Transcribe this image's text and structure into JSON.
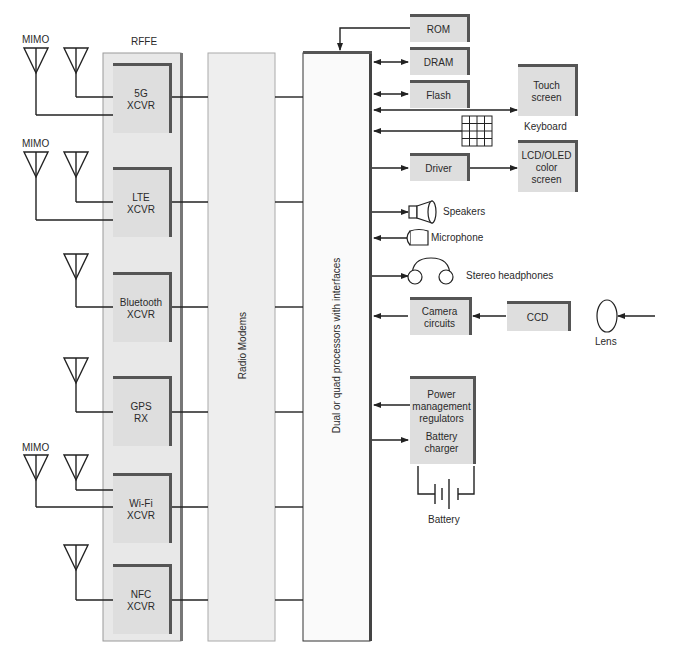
{
  "diagram": {
    "rffe_label": "RFFE",
    "radio_modems_label": "Radio Modems",
    "processor_label": "Dual or quad processors with interfaces",
    "antenna_labels": {
      "mimo_top": "MIMO",
      "mimo_lte": "MIMO",
      "mimo_wifi": "MIMO"
    },
    "transceivers": [
      {
        "line1": "5G",
        "line2": "XCVR"
      },
      {
        "line1": "LTE",
        "line2": "XCVR"
      },
      {
        "line1": "Bluetooth",
        "line2": "XCVR"
      },
      {
        "line1": "GPS",
        "line2": "RX"
      },
      {
        "line1": "Wi-Fi",
        "line2": "XCVR"
      },
      {
        "line1": "NFC",
        "line2": "XCVR"
      }
    ],
    "memory": {
      "rom": "ROM",
      "dram": "DRAM",
      "flash": "Flash"
    },
    "touch_screen": {
      "line1": "Touch",
      "line2": "screen"
    },
    "keyboard": "Keyboard",
    "driver": "Driver",
    "display": {
      "line1": "LCD/OLED",
      "line2": "color",
      "line3": "screen"
    },
    "speakers": "Speakers",
    "microphone": "Microphone",
    "headphones": "Stereo headphones",
    "camera": {
      "line1": "Camera",
      "line2": "circuits"
    },
    "ccd": "CCD",
    "lens": "Lens",
    "power": {
      "line1": "Power",
      "line2": "management",
      "line3": "regulators",
      "line4": "Battery",
      "line5": "charger"
    },
    "battery": "Battery"
  }
}
